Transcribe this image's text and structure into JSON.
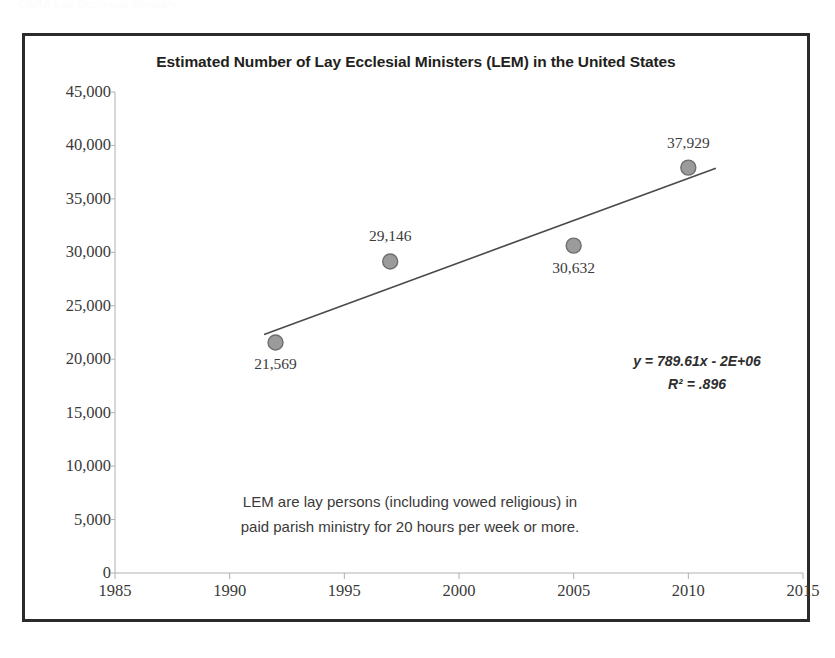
{
  "page": {
    "top_strip_text": "CARA Lay Ecclesial Ministry"
  },
  "chart_frame": {
    "border_color": "#2b2b2b"
  },
  "equation": {
    "line1": "y = 789.61x - 2E+06",
    "line2": "R² = .896"
  },
  "definition": {
    "line1": "LEM are lay persons (including vowed religious) in",
    "line2": "paid parish ministry for 20 hours per week or more."
  },
  "chart_data": {
    "type": "scatter",
    "title": "Estimated Number of Lay Ecclesial Ministers (LEM) in the United States",
    "xlabel": "",
    "ylabel": "",
    "xlim": [
      1985,
      2015
    ],
    "ylim": [
      0,
      45000
    ],
    "grid": false,
    "legend": "none",
    "x_tick_labels": [
      "1985",
      "1990",
      "1995",
      "2000",
      "2005",
      "2010",
      "2015"
    ],
    "x_ticks": [
      1985,
      1990,
      1995,
      2000,
      2005,
      2010,
      2015
    ],
    "y_tick_labels": [
      "0",
      "5,000",
      "10,000",
      "15,000",
      "20,000",
      "25,000",
      "30,000",
      "35,000",
      "40,000",
      "45,000"
    ],
    "y_ticks": [
      0,
      5000,
      10000,
      15000,
      20000,
      25000,
      30000,
      35000,
      40000,
      45000
    ],
    "marker_color": "#9b9b9b",
    "marker_edge_color": "#6e6e6e",
    "trendline_color": "#4a4a4a",
    "points": [
      {
        "x": 1992,
        "y": 21569,
        "label": "21,569",
        "label_position": "below"
      },
      {
        "x": 1997,
        "y": 29146,
        "label": "29,146",
        "label_position": "above"
      },
      {
        "x": 2005,
        "y": 30632,
        "label": "30,632",
        "label_position": "below"
      },
      {
        "x": 2010,
        "y": 37929,
        "label": "37,929",
        "label_position": "above"
      }
    ],
    "trendline": {
      "equation": "y = 789.61x - 2E+06",
      "r_squared": ".896",
      "slope": 789.61,
      "x_start": 1991.5,
      "x_end": 2011.2
    }
  }
}
